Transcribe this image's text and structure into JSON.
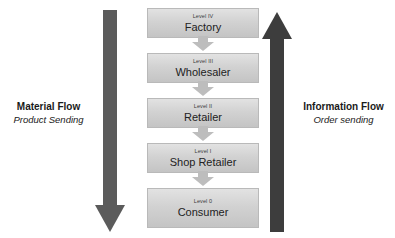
{
  "diagram": {
    "background_color": "#ffffff"
  },
  "chain": {
    "nodes": [
      {
        "level": "Level IV",
        "name": "Factory"
      },
      {
        "level": "Level III",
        "name": "Wholesaler"
      },
      {
        "level": "Level II",
        "name": "Retailer"
      },
      {
        "level": "Level I",
        "name": "Shop Retailer"
      },
      {
        "level": "Level 0",
        "name": "Consumer"
      }
    ],
    "box_fill_color": "#d4d4d4",
    "box_border_color": "#b9b9b9",
    "connector_color": "#bdbdbd"
  },
  "material_flow": {
    "title": "Material Flow",
    "subtitle": "Product Sending",
    "direction": "down",
    "arrow_color": "#5b5b5b"
  },
  "information_flow": {
    "title": "Information Flow",
    "subtitle": "Order sending",
    "direction": "up",
    "arrow_color": "#3d3d3d"
  }
}
